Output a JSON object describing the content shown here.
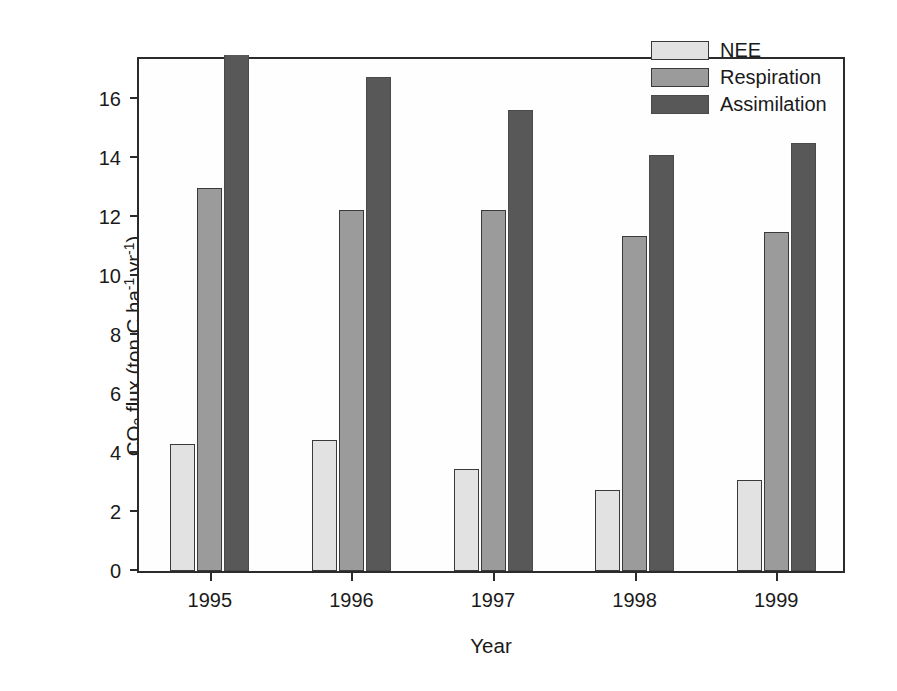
{
  "chart_data": {
    "type": "bar",
    "title": "",
    "xlabel": "Year",
    "ylabel": "CO2 flux (ton C ha-1 yr-1)",
    "ylabel_parts": {
      "prefix": "CO",
      "sub": "2",
      "mid": " flux (ton C ha",
      "sup1": "-1",
      "mid2": " yr",
      "sup2": "-1",
      "suffix": ")"
    },
    "categories": [
      "1995",
      "1996",
      "1997",
      "1998",
      "1999"
    ],
    "series": [
      {
        "name": "NEE",
        "color": "#e2e2e2",
        "values": [
          4.3,
          4.45,
          3.45,
          2.75,
          3.1
        ]
      },
      {
        "name": "Respiration",
        "color": "#9b9b9b",
        "values": [
          13.0,
          12.25,
          12.25,
          11.35,
          11.5
        ]
      },
      {
        "name": "Assimilation",
        "color": "#585858",
        "values": [
          17.5,
          16.75,
          15.65,
          14.1,
          14.5
        ]
      }
    ],
    "ylim": [
      0,
      17.5
    ],
    "yticks": [
      0,
      2,
      4,
      6,
      8,
      10,
      12,
      14,
      16
    ],
    "ytick_labels": [
      "0",
      "2",
      "4",
      "6",
      "8",
      "10",
      "12",
      "14",
      "16"
    ],
    "grid": false,
    "legend_position": "top-right",
    "note": "1995 Assimilation bar is clipped by the top of the plot frame"
  },
  "legend": {
    "entries": [
      {
        "label": "NEE"
      },
      {
        "label": "Respiration"
      },
      {
        "label": "Assimilation"
      }
    ]
  }
}
